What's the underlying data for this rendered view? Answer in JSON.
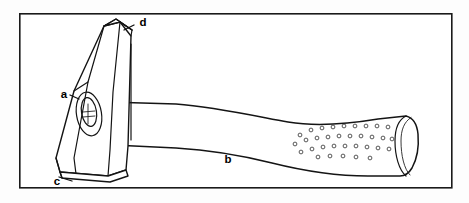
{
  "diagram": {
    "type": "labelled technical line illustration",
    "frame": {
      "name": "diagram-border",
      "x": 19,
      "y": 13,
      "width": 433,
      "height": 175,
      "stroke_color": "#1a1a1a",
      "fill_color": "#ffffff"
    },
    "background_color": "#fdfdfd",
    "line_color": "#141414",
    "labels": [
      {
        "key": "a",
        "text": "a",
        "x": 64,
        "y": 95,
        "part": "eye / wedge hole of hammer head",
        "leader": "points right into the oval eye on the head face"
      },
      {
        "key": "b",
        "text": "b",
        "x": 228,
        "y": 160,
        "part": "handle / shaft",
        "leader": "none"
      },
      {
        "key": "c",
        "text": "c",
        "x": 57,
        "y": 182,
        "part": "lower striking face of head",
        "leader": "short line up-right to the bottom face edge"
      },
      {
        "key": "d",
        "text": "d",
        "x": 143,
        "y": 23,
        "part": "upper striking face of head",
        "leader": "short line down-left to the top face edge"
      }
    ],
    "parts": {
      "head": {
        "name": "hammer-head",
        "description": "tapered rectangular steel head tilted left, top and bottom striking faces visible"
      },
      "eye": {
        "name": "hammer-eye",
        "description": "oval hole where handle passes through, with inner wedge detail"
      },
      "handle": {
        "name": "hammer-handle",
        "description": "long shaft narrowing at the middle and flaring to a stippled rubber grip at the far end"
      },
      "grip": {
        "name": "hammer-grip",
        "description": "textured grip area drawn as scattered small open circles",
        "dot_count": 34
      },
      "butt": {
        "name": "handle-butt-cap",
        "description": "rounded end cap at the right extremity of the handle"
      }
    }
  }
}
